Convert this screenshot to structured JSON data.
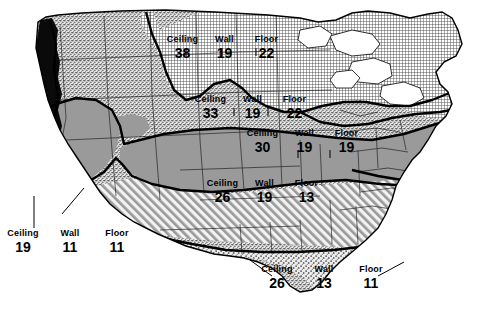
{
  "columns": [
    "Ceiling",
    "Wall",
    "Floor"
  ],
  "zones": [
    {
      "id": "north-central",
      "pattern": "cross-hatch",
      "ceiling": "38",
      "wall": "19",
      "floor": "22",
      "header": [
        "Ceiling",
        "Wall",
        "Floor"
      ]
    },
    {
      "id": "upper-mountain",
      "pattern": "fine-stipple",
      "ceiling": "33",
      "wall": "19",
      "floor": "22",
      "header": [
        "Ceiling",
        "Wall",
        "Floor"
      ]
    },
    {
      "id": "central-band",
      "pattern": "solid-gray",
      "ceiling": "30",
      "wall": "19",
      "floor": "19",
      "header": [
        "Ceiling",
        "Wall",
        "Floor"
      ]
    },
    {
      "id": "south-central",
      "pattern": "diagonal-hatch",
      "ceiling": "26",
      "wall": "19",
      "floor": "13",
      "header": [
        "Ceiling",
        "Wall",
        "Floor"
      ]
    },
    {
      "id": "gulf-south",
      "pattern": "coarse-stipple",
      "ceiling": "26",
      "wall": "13",
      "floor": "11",
      "header": [
        "Ceiling",
        "Wall",
        "Floor"
      ]
    },
    {
      "id": "pacific-coast",
      "pattern": "black",
      "ceiling": "19",
      "wall": "11",
      "floor": "11",
      "header": [
        "Ceiling",
        "Wall",
        "Floor"
      ]
    }
  ],
  "colors": {
    "gray_fill": "#9a9a9a",
    "black_fill": "#0a0a0a",
    "stipple_bg": "#e2e2e2",
    "line": "#000000",
    "background": "#ffffff"
  }
}
